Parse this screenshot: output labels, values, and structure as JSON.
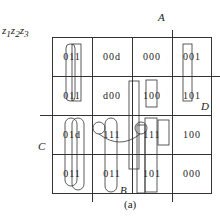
{
  "corner_label": "z1z2z3",
  "variables": {
    "top": "A",
    "right": "D",
    "left": "C",
    "bottom": "B"
  },
  "cells": [
    [
      "011",
      "00d",
      "000",
      "001"
    ],
    [
      "011",
      "d00",
      "100",
      "101"
    ],
    [
      "01d",
      "111",
      "111",
      "100"
    ],
    [
      "011",
      "011",
      "101",
      "000"
    ]
  ],
  "caption": "(a)"
}
